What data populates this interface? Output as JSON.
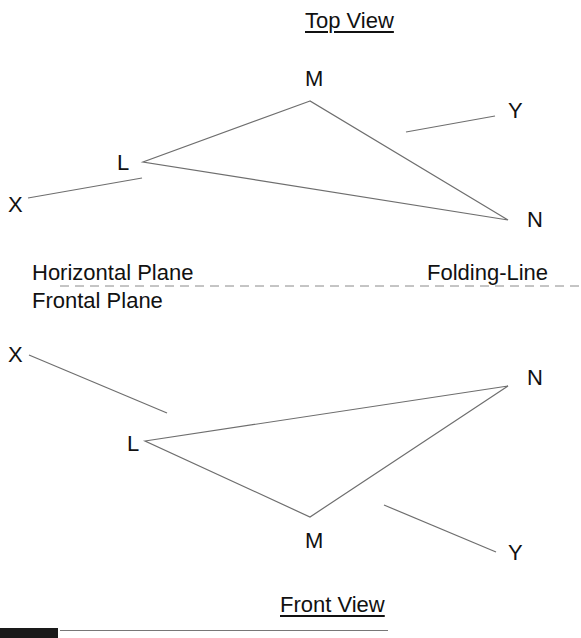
{
  "top_view": {
    "title": "Top View",
    "points": {
      "M": {
        "label": "M",
        "x": 310,
        "y": 101
      },
      "L": {
        "label": "L",
        "x": 143,
        "y": 162
      },
      "N": {
        "label": "N",
        "x": 508,
        "y": 220
      },
      "X": {
        "label": "X"
      },
      "Y": {
        "label": "Y"
      }
    },
    "x_line": {
      "x1": 28,
      "y1": 198,
      "x2": 142,
      "y2": 178
    },
    "y_line": {
      "x1": 406,
      "y1": 132,
      "x2": 495,
      "y2": 116
    }
  },
  "folding": {
    "horizontal_plane_label": "Horizontal Plane",
    "frontal_plane_label": "Frontal Plane",
    "folding_line_label": "Folding-Line"
  },
  "front_view": {
    "title": "Front View",
    "points": {
      "X": {
        "label": "X"
      },
      "L": {
        "label": "L",
        "x": 145,
        "y": 441
      },
      "N": {
        "label": "N",
        "x": 508,
        "y": 386
      },
      "M": {
        "label": "M",
        "x": 310,
        "y": 517
      },
      "Y": {
        "label": "Y"
      }
    },
    "x_line": {
      "x1": 29,
      "y1": 355,
      "x2": 167,
      "y2": 413
    },
    "y_line": {
      "x1": 384,
      "y1": 505,
      "x2": 496,
      "y2": 552
    }
  },
  "colors": {
    "line": "#6e6e6e",
    "text": "#111111",
    "dash": "#8a8a8a"
  }
}
